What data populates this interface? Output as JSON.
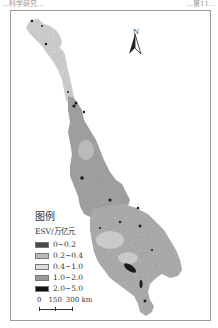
{
  "header": {
    "left_text": "…科学研究…",
    "right_text": "…第11…"
  },
  "map": {
    "north_label": "N",
    "legend": {
      "title": "图例",
      "subtitle": "ESV/万亿元",
      "items": [
        {
          "label": "0~0.2",
          "color": "#4a4a4a"
        },
        {
          "label": "0.2~0.4",
          "color": "#b9b9b9"
        },
        {
          "label": "0.4~1.0",
          "color": "#dedede"
        },
        {
          "label": "1.0~2.0",
          "color": "#9a9a9a"
        },
        {
          "label": "2.0~5.0",
          "color": "#121212"
        }
      ]
    },
    "scale_bar": {
      "labels": [
        "0",
        "150",
        "300 km"
      ]
    }
  }
}
